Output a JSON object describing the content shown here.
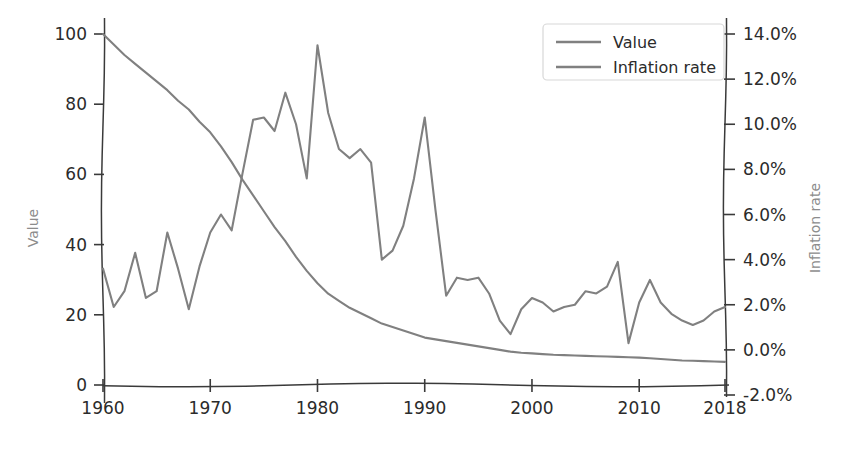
{
  "chart_data": {
    "type": "line",
    "title": "",
    "xlabel": "",
    "grid": false,
    "legend_position": "top-right",
    "x": [
      1960,
      1961,
      1962,
      1963,
      1964,
      1965,
      1966,
      1967,
      1968,
      1969,
      1970,
      1971,
      1972,
      1973,
      1974,
      1975,
      1976,
      1977,
      1978,
      1979,
      1980,
      1981,
      1982,
      1983,
      1984,
      1985,
      1986,
      1987,
      1988,
      1989,
      1990,
      1991,
      1992,
      1993,
      1994,
      1995,
      1996,
      1997,
      1998,
      1999,
      2000,
      2001,
      2002,
      2003,
      2004,
      2005,
      2006,
      2007,
      2008,
      2009,
      2010,
      2011,
      2012,
      2013,
      2014,
      2015,
      2016,
      2017,
      2018
    ],
    "xtick_labels": [
      "1960",
      "1970",
      "1980",
      "1990",
      "2000",
      "2010",
      "2018"
    ],
    "xticks": [
      1960,
      1970,
      1980,
      1990,
      2000,
      2010,
      2018
    ],
    "xlim": [
      1960,
      2018
    ],
    "axes": [
      {
        "id": "left",
        "ylabel": "Value",
        "ylim": [
          0,
          100
        ],
        "yticks": [
          0,
          20,
          40,
          60,
          80,
          100
        ],
        "ytick_labels": [
          "0",
          "20",
          "40",
          "60",
          "80",
          "100"
        ]
      },
      {
        "id": "right",
        "ylabel": "Inflation rate",
        "ylim": [
          -2.0,
          14.0
        ],
        "yticks": [
          -2.0,
          0.0,
          2.0,
          4.0,
          6.0,
          8.0,
          10.0,
          12.0,
          14.0
        ],
        "ytick_labels": [
          "-2.0%",
          "0.0%",
          "2.0%",
          "4.0%",
          "6.0%",
          "8.0%",
          "10.0%",
          "12.0%",
          "14.0%"
        ]
      }
    ],
    "series": [
      {
        "name": "Value",
        "axis": "left",
        "color": "#808080",
        "values": [
          100.0,
          97.0,
          94.0,
          91.5,
          89.0,
          86.5,
          84.0,
          81.0,
          78.5,
          75.0,
          72.0,
          68.0,
          63.5,
          58.5,
          54.0,
          49.5,
          45.0,
          41.0,
          36.5,
          32.5,
          29.0,
          26.0,
          24.0,
          22.0,
          20.5,
          19.0,
          17.5,
          16.5,
          15.5,
          14.5,
          13.5,
          13.0,
          12.5,
          12.0,
          11.5,
          11.0,
          10.5,
          10.0,
          9.5,
          9.2,
          9.0,
          8.8,
          8.6,
          8.5,
          8.4,
          8.3,
          8.2,
          8.1,
          8.0,
          7.9,
          7.8,
          7.6,
          7.4,
          7.2,
          7.0,
          6.9,
          6.8,
          6.7,
          6.6
        ]
      },
      {
        "name": "Inflation rate",
        "axis": "right",
        "color": "#808080",
        "values": [
          3.6,
          1.9,
          2.6,
          4.3,
          2.3,
          2.6,
          5.2,
          3.6,
          1.8,
          3.7,
          5.2,
          6.0,
          5.3,
          7.8,
          10.2,
          10.3,
          9.7,
          11.4,
          10.0,
          7.6,
          13.5,
          10.5,
          8.9,
          8.5,
          8.9,
          8.3,
          4.0,
          4.4,
          5.5,
          7.6,
          10.3,
          6.2,
          2.4,
          3.2,
          3.1,
          3.2,
          2.5,
          1.3,
          0.7,
          1.8,
          2.3,
          2.1,
          1.7,
          1.9,
          2.0,
          2.6,
          2.5,
          2.8,
          3.9,
          0.3,
          2.1,
          3.1,
          2.1,
          1.6,
          1.3,
          1.1,
          1.3,
          1.7,
          1.9
        ]
      }
    ],
    "legend_entries": [
      "Value",
      "Inflation rate"
    ]
  },
  "colors": {
    "series_line": "#808080",
    "tick_text": "#2b2b2b",
    "axis_title": "#8c8c8c",
    "axis_spine": "#3a3a3a",
    "legend_border": "#d8d8d8",
    "background": "#ffffff"
  }
}
